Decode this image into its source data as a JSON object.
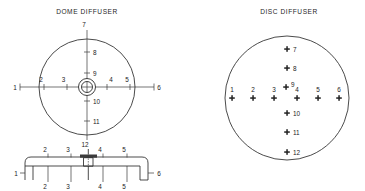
{
  "figure": {
    "background_color": "#ffffff",
    "line_color": "#2b2b2b",
    "text_color": "#1c1c1c"
  },
  "dome": {
    "title": "DOME DIFFUSER",
    "center": {
      "x": 87,
      "y": 87
    },
    "radius": 48,
    "horizontal_axis": {
      "labels": [
        "1",
        "2",
        "3",
        "4",
        "5",
        "6"
      ],
      "points": [
        {
          "label": "1",
          "x": 20,
          "y": 87,
          "label_x": 15,
          "label_y": 89,
          "tick": false,
          "endcap": true
        },
        {
          "label": "2",
          "x": 44,
          "y": 87,
          "label_x": 41,
          "label_y": 81,
          "tick": true,
          "endcap": false
        },
        {
          "label": "3",
          "x": 67,
          "y": 87,
          "label_x": 63,
          "label_y": 81,
          "tick": true,
          "endcap": false
        },
        {
          "label": "4",
          "x": 107,
          "y": 87,
          "label_x": 104,
          "label_y": 81,
          "tick": true,
          "endcap": false
        },
        {
          "label": "5",
          "x": 130,
          "y": 87,
          "label_x": 126,
          "label_y": 81,
          "tick": true,
          "endcap": false
        },
        {
          "label": "6",
          "x": 154,
          "y": 87,
          "label_x": 157,
          "label_y": 89,
          "tick": false,
          "endcap": true
        }
      ]
    },
    "vertical_axis": {
      "labels": [
        "7",
        "8",
        "9",
        "10",
        "11",
        "12"
      ],
      "points": [
        {
          "label": "7",
          "x": 87,
          "y": 30,
          "label_x": 84,
          "label_y": 27,
          "tick": false
        },
        {
          "label": "8",
          "x": 87,
          "y": 52,
          "label_x": 91,
          "label_y": 54,
          "tick": true
        },
        {
          "label": "9",
          "x": 87,
          "y": 73,
          "label_x": 91,
          "label_y": 75,
          "tick": true
        },
        {
          "label": "10",
          "x": 87,
          "y": 101,
          "label_x": 91,
          "label_y": 104,
          "tick": true
        },
        {
          "label": "11",
          "x": 87,
          "y": 121,
          "label_x": 91,
          "label_y": 124,
          "tick": true
        },
        {
          "label": "12",
          "x": 87,
          "y": 140,
          "label_x": 84,
          "label_y": 147,
          "tick": false
        }
      ]
    },
    "hub": {
      "outer_radius": 8.5,
      "inner_radius": 5.5,
      "crosshair": true
    }
  },
  "profile": {
    "baseline_y": 172,
    "top_y": 156,
    "left_end_x": 25,
    "right_end_x": 152,
    "stem": {
      "x": 88,
      "top_y": 150,
      "bottom_y": 180
    },
    "top_labels": [
      "2",
      "3",
      "4",
      "5"
    ],
    "bottom_labels": [
      "2",
      "3",
      "4",
      "5"
    ],
    "points": [
      {
        "label": "2",
        "x": 48,
        "top_label_x": 45,
        "top_label_y": 152,
        "bottom_label_x": 45,
        "bottom_label_y": 189
      },
      {
        "label": "3",
        "x": 71,
        "top_label_x": 68,
        "top_label_y": 152,
        "bottom_label_x": 68,
        "bottom_label_y": 189
      },
      {
        "label": "4",
        "x": 101,
        "top_label_x": 98,
        "top_label_y": 152,
        "bottom_label_x": 98,
        "bottom_label_y": 189
      },
      {
        "label": "5",
        "x": 127,
        "top_label_x": 124,
        "top_label_y": 152,
        "bottom_label_x": 124,
        "bottom_label_y": 189
      }
    ],
    "end_labels": [
      {
        "label": "1",
        "x": 18,
        "y": 175
      },
      {
        "label": "6",
        "x": 158,
        "y": 175
      }
    ],
    "top_center_label": {
      "label": "12",
      "x": 85,
      "y": 148
    }
  },
  "disc": {
    "title": "DISC DIFFUSER",
    "center": {
      "x": 287,
      "y": 98
    },
    "radius": 62,
    "horizontal_points": [
      {
        "label": "1",
        "x": 232,
        "y": 98,
        "label_x": 229,
        "label_y": 92
      },
      {
        "label": "2",
        "x": 253,
        "y": 98,
        "label_x": 250,
        "label_y": 92
      },
      {
        "label": "3",
        "x": 274,
        "y": 98,
        "label_x": 271,
        "label_y": 92
      },
      {
        "label": "4",
        "x": 297,
        "y": 98,
        "label_x": 294,
        "label_y": 92
      },
      {
        "label": "5",
        "x": 318,
        "y": 98,
        "label_x": 315,
        "label_y": 92
      },
      {
        "label": "6",
        "x": 339,
        "y": 98,
        "label_x": 336,
        "label_y": 92
      }
    ],
    "vertical_points": [
      {
        "label": "7",
        "x": 287,
        "y": 49,
        "label_x": 293,
        "label_y": 51
      },
      {
        "label": "8",
        "x": 287,
        "y": 68,
        "label_x": 293,
        "label_y": 70
      },
      {
        "label": "9",
        "x": 287,
        "y": 87,
        "label_x": 293,
        "label_y": 87
      },
      {
        "label": "10",
        "x": 287,
        "y": 113,
        "label_x": 293,
        "label_y": 116
      },
      {
        "label": "11",
        "x": 287,
        "y": 132,
        "label_x": 293,
        "label_y": 135
      },
      {
        "label": "12",
        "x": 287,
        "y": 152,
        "label_x": 293,
        "label_y": 155
      }
    ],
    "marker_shape": "cross"
  }
}
